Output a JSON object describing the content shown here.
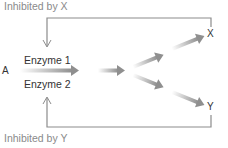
{
  "diagram": {
    "type": "feedback-inhibition pathway",
    "labels": {
      "inhibited_x": "Inhibited by X",
      "inhibited_y": "Inhibited by Y",
      "enzyme1": "Enzyme 1",
      "enzyme2": "Enzyme 2",
      "substrate": "A",
      "product_x": "X",
      "product_y": "Y"
    },
    "colors": {
      "line": "#8c8c8c",
      "arrow": "#8f8f8f",
      "text_gray": "#8a8a8a",
      "text_dark": "#333333"
    },
    "edges": [
      {
        "from": "A",
        "to": "intermediate",
        "label": "Enzyme 1 / Enzyme 2"
      },
      {
        "from": "intermediate",
        "to": "branch"
      },
      {
        "from": "branch",
        "to": "X"
      },
      {
        "from": "branch",
        "to": "Y"
      },
      {
        "from": "X",
        "to": "Enzyme 1",
        "type": "inhibition"
      },
      {
        "from": "Y",
        "to": "Enzyme 2",
        "type": "inhibition"
      }
    ]
  }
}
